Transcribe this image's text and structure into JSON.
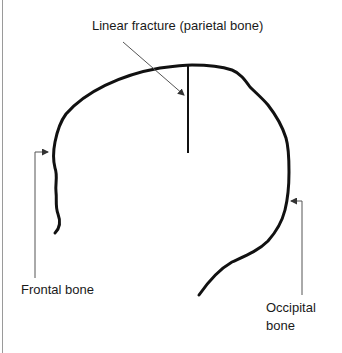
{
  "diagram": {
    "type": "anatomical-sketch",
    "labels": {
      "fracture": "Linear fracture (parietal bone)",
      "frontal": "Frontal bone",
      "occipital_line1": "Occipital",
      "occipital_line2": "bone"
    },
    "colors": {
      "outline": "#111111",
      "leader_line": "#555555",
      "text": "#1a1a1a",
      "background": "#ffffff"
    }
  }
}
